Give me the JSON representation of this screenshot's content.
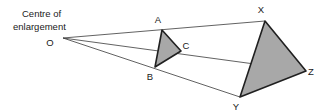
{
  "diagram": {
    "type": "geometry-enlargement",
    "caption": {
      "line1": "Centre of",
      "line2": "enlargement"
    },
    "colors": {
      "shape_fill": "#a8a8a8",
      "shape_stroke": "#202020",
      "ray_stroke": "#3a3a3a",
      "label_color": "#1a1a1a",
      "background": "#ffffff"
    },
    "centre": {
      "label": "O",
      "point": "63,38",
      "label_x": "50",
      "label_y": "46"
    },
    "object_triangle": {
      "name": "ABC",
      "points": "162,30 155,67 181,51",
      "vertices": [
        {
          "label": "A",
          "x": "162",
          "y": "30",
          "label_x": "158",
          "label_y": "23"
        },
        {
          "label": "B",
          "x": "155",
          "y": "67",
          "label_x": "150",
          "label_y": "80"
        },
        {
          "label": "C",
          "x": "181",
          "y": "51",
          "label_x": "186",
          "label_y": "49"
        }
      ]
    },
    "image_triangle": {
      "name": "XYZ",
      "points": "265,21 240,97 306,71",
      "vertices": [
        {
          "label": "X",
          "x": "265",
          "y": "21",
          "label_x": "261",
          "label_y": "13"
        },
        {
          "label": "Y",
          "x": "240",
          "y": "97",
          "label_x": "236",
          "label_y": "110"
        },
        {
          "label": "Z",
          "x": "306",
          "y": "71",
          "label_x": "311",
          "label_y": "75"
        }
      ]
    },
    "rays": [
      {
        "name": "ray-O-A-X",
        "d": "M 63,38 L 265,21"
      },
      {
        "name": "ray-O-C-Z",
        "d": "M 63,38 L 306,71"
      },
      {
        "name": "ray-O-B-Y",
        "d": "M 63,38 L 240,97"
      }
    ]
  }
}
